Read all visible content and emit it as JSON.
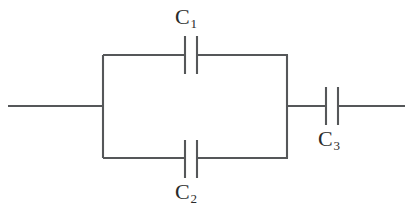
{
  "diagram": {
    "type": "circuit-schematic",
    "background_color": "#ffffff",
    "line_color": "#555759",
    "label_color": "#2b2b2b",
    "components": [
      {
        "id": "c1",
        "label": "C",
        "subscript": "1",
        "kind": "capacitor",
        "orientation": "horizontal",
        "branch": "parallel-top",
        "label_position": "above"
      },
      {
        "id": "c2",
        "label": "C",
        "subscript": "2",
        "kind": "capacitor",
        "orientation": "horizontal",
        "branch": "parallel-bottom",
        "label_position": "below"
      },
      {
        "id": "c3",
        "label": "C",
        "subscript": "3",
        "kind": "capacitor",
        "orientation": "horizontal",
        "branch": "series-right",
        "label_position": "below"
      }
    ],
    "terminals": [
      {
        "id": "left-terminal",
        "side": "left"
      },
      {
        "id": "right-terminal",
        "side": "right"
      }
    ]
  }
}
